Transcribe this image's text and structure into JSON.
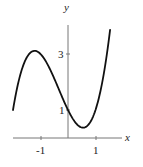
{
  "chart_data": {
    "type": "line",
    "title": "",
    "xlabel": "x",
    "ylabel": "y",
    "function": "x^3 + x^2 - 2x + 1",
    "x_ticks": [
      {
        "value": -1,
        "label": "-1"
      },
      {
        "value": 1,
        "label": "1"
      }
    ],
    "y_ticks": [
      {
        "value": 1,
        "label": "1"
      },
      {
        "value": 3,
        "label": "3"
      }
    ],
    "xlim": [
      -2,
      2
    ],
    "ylim": [
      0,
      4.2
    ],
    "grid": false,
    "series": [
      {
        "name": "f(x)",
        "x": [
          -2.0,
          -1.8,
          -1.6,
          -1.4,
          -1.215,
          -1.0,
          -0.8,
          -0.6,
          -0.4,
          -0.2,
          0.0,
          0.2,
          0.4,
          0.549,
          0.7,
          0.9,
          1.1,
          1.3,
          1.53
        ],
        "values": [
          1.0,
          2.01,
          2.66,
          3.02,
          3.11,
          3.0,
          2.73,
          2.34,
          1.9,
          1.43,
          1.0,
          0.65,
          0.42,
          0.37,
          0.43,
          0.82,
          1.35,
          2.28,
          3.86
        ]
      }
    ],
    "key_points": {
      "local_max": {
        "x": -1.215,
        "y": 3.11
      },
      "local_min": {
        "x": 0.549,
        "y": 0.37
      },
      "y_intercept": {
        "x": 0,
        "y": 1
      }
    }
  },
  "labels": {
    "x_axis": "x",
    "y_axis": "y",
    "tick_x_neg1": "-1",
    "tick_x_1": "1",
    "tick_y_1": "1",
    "tick_y_3": "3"
  }
}
